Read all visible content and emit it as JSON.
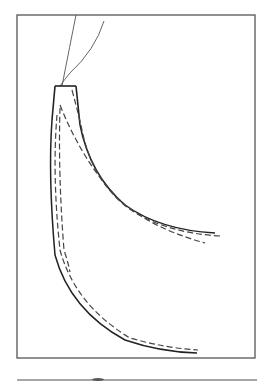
{
  "diagram": {
    "frame": {
      "x": 17,
      "y": 15,
      "width": 238,
      "height": 343,
      "stroke": "#555555"
    },
    "colors": {
      "solid": "#222222",
      "dashed": "#444444",
      "thin": "#555555",
      "strip": "#888888"
    },
    "legend": [],
    "labels": []
  }
}
